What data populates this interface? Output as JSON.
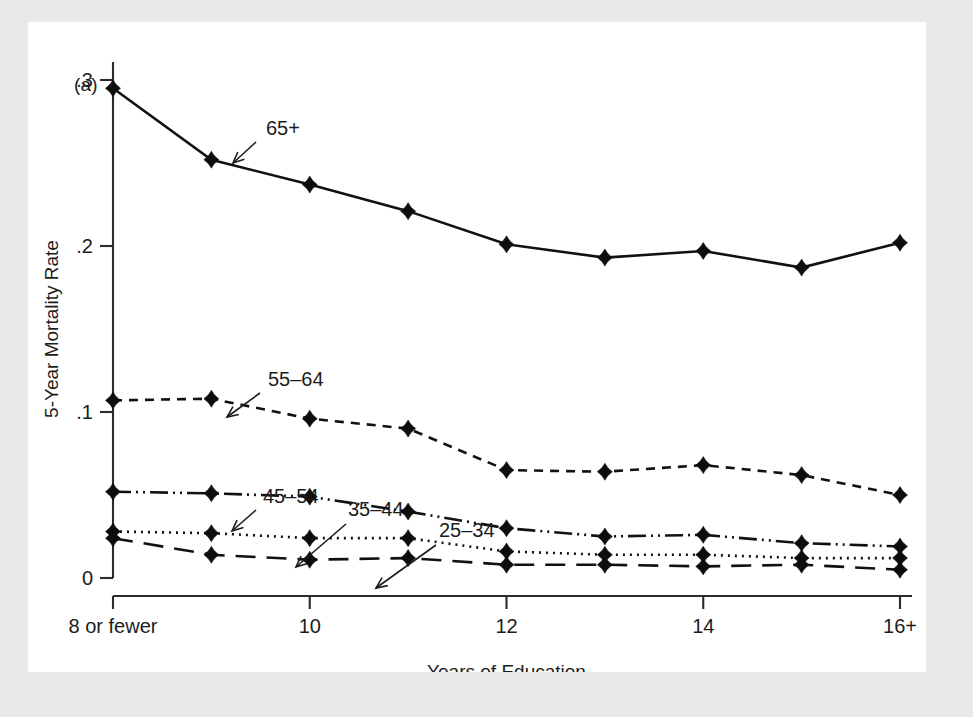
{
  "figure": {
    "panel_label": "(a)",
    "background_color": "#e9e9e9",
    "plot_background_color": "#ffffff",
    "line_color": "#111111"
  },
  "chart_data": {
    "type": "line",
    "title": "",
    "xlabel": "Years of Education",
    "ylabel": "5-Year Mortality Rate",
    "x": [
      8,
      9,
      10,
      11,
      12,
      13,
      14,
      15,
      16
    ],
    "categories": [
      "8 or fewer",
      "9",
      "10",
      "11",
      "12",
      "13",
      "14",
      "15",
      "16+"
    ],
    "xtick_positions": [
      8,
      10,
      12,
      14,
      16
    ],
    "xtick_labels": [
      "8 or fewer",
      "10",
      "12",
      "14",
      "16+"
    ],
    "ytick_values": [
      0,
      0.1,
      0.2,
      0.3
    ],
    "ytick_labels": [
      "0",
      ".1",
      ".2",
      ".3"
    ],
    "xlim": [
      8,
      16
    ],
    "ylim": [
      0,
      0.3
    ],
    "grid": false,
    "legend": "inline-annotations",
    "series": [
      {
        "name": "65+",
        "label": "65+",
        "linestyle": "solid",
        "dasharray": "none",
        "values": [
          0.295,
          0.252,
          0.237,
          0.221,
          0.201,
          0.193,
          0.197,
          0.187,
          0.202
        ]
      },
      {
        "name": "55-64",
        "label": "55–64",
        "linestyle": "dashed",
        "dasharray": "9,7",
        "values": [
          0.107,
          0.108,
          0.096,
          0.09,
          0.065,
          0.064,
          0.068,
          0.062,
          0.05
        ]
      },
      {
        "name": "45-54",
        "label": "45–54",
        "linestyle": "dash-dot-dot",
        "dasharray": "18,5,2,5,2,5",
        "values": [
          0.052,
          0.051,
          0.049,
          0.04,
          0.03,
          0.025,
          0.026,
          0.021,
          0.019
        ]
      },
      {
        "name": "35-44",
        "label": "35–44",
        "linestyle": "dotted",
        "dasharray": "2,5",
        "values": [
          0.028,
          0.027,
          0.024,
          0.024,
          0.016,
          0.014,
          0.014,
          0.012,
          0.012
        ]
      },
      {
        "name": "25-34",
        "label": "25–34",
        "linestyle": "long-dash",
        "dasharray": "20,11",
        "values": [
          0.024,
          0.014,
          0.011,
          0.012,
          0.008,
          0.008,
          0.007,
          0.008,
          0.005
        ]
      }
    ],
    "annotations": [
      {
        "text": "65+",
        "series": "65+",
        "text_x": 238,
        "text_y": 113,
        "arrow_from_x": 228,
        "arrow_from_y": 120,
        "arrow_to_x": 205,
        "arrow_to_y": 141
      },
      {
        "text": "55–64",
        "series": "55-64",
        "text_x": 240,
        "text_y": 364,
        "arrow_from_x": 232,
        "arrow_from_y": 371,
        "arrow_to_x": 199,
        "arrow_to_y": 395
      },
      {
        "text": "45–54",
        "series": "45-54",
        "text_x": 235,
        "text_y": 481,
        "arrow_from_x": 228,
        "arrow_from_y": 488,
        "arrow_to_x": 204,
        "arrow_to_y": 509
      },
      {
        "text": "35–44",
        "series": "35-44",
        "text_x": 320,
        "text_y": 494,
        "arrow_from_x": 318,
        "arrow_from_y": 502,
        "arrow_to_x": 268,
        "arrow_to_y": 545
      },
      {
        "text": "25–34",
        "series": "25-34",
        "text_x": 411,
        "text_y": 515,
        "arrow_from_x": 408,
        "arrow_from_y": 523,
        "arrow_to_x": 348,
        "arrow_to_y": 566
      }
    ]
  }
}
